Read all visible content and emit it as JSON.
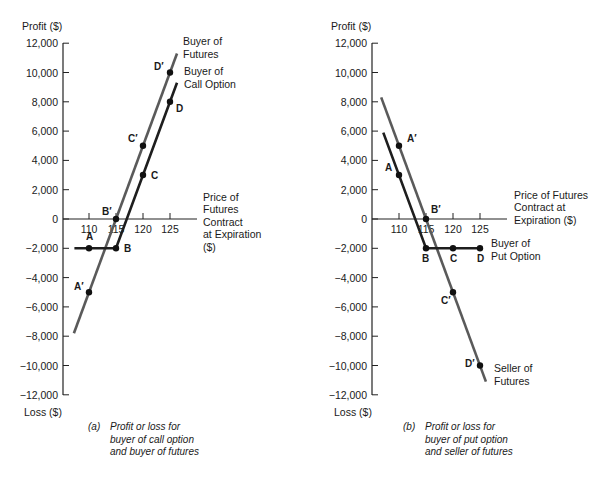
{
  "chart_data": [
    {
      "type": "line",
      "panel": "a",
      "title": "(a) Profit or loss for buyer of call option and buyer of futures",
      "caption_lines": [
        "(a)",
        "Profit or loss for",
        "buyer of call option",
        "and buyer of futures"
      ],
      "ylabel_top": "Profit ($)",
      "ylabel_bottom": "Loss ($)",
      "xlabel_lines": [
        "Price of",
        "Futures",
        "Contract",
        "at Expiration",
        "($)"
      ],
      "ylim": [
        -12000,
        12000
      ],
      "yticks": [
        12000,
        10000,
        8000,
        6000,
        4000,
        2000,
        0,
        -2000,
        -4000,
        -6000,
        -8000,
        -10000,
        -12000
      ],
      "ytick_labels": [
        "12,000",
        "10,000",
        "8,000",
        "6,000",
        "4,000",
        "2,000",
        "0",
        "−2,000",
        "−4,000",
        "−6,000",
        "−8,000",
        "−10,000",
        "−12,000"
      ],
      "xticks": [
        110,
        115,
        120,
        125
      ],
      "xtick_labels": [
        "110",
        "115",
        "120",
        "125"
      ],
      "grid": false,
      "series": [
        {
          "name": "Buyer of Futures",
          "label_lines": [
            "Buyer of",
            "Futures"
          ],
          "color": "#5a5a5a",
          "line": [
            [
              107.2,
              -7800
            ],
            [
              126.3,
              11300
            ]
          ],
          "points": [
            {
              "label": "A′",
              "x": 110,
              "y": -5000
            },
            {
              "label": "B′",
              "x": 115,
              "y": 0
            },
            {
              "label": "C′",
              "x": 120,
              "y": 5000
            },
            {
              "label": "D′",
              "x": 125,
              "y": 10000
            }
          ]
        },
        {
          "name": "Buyer of Call Option",
          "label_lines": [
            "Buyer of",
            "Call Option"
          ],
          "color": "#1e1e1e",
          "line": [
            [
              107.3,
              -2000
            ],
            [
              115,
              -2000
            ],
            [
              126.3,
              9300
            ]
          ],
          "points": [
            {
              "label": "A",
              "x": 110,
              "y": -2000
            },
            {
              "label": "B",
              "x": 115,
              "y": -2000
            },
            {
              "label": "C",
              "x": 120,
              "y": 3000
            },
            {
              "label": "D",
              "x": 125,
              "y": 8000
            }
          ]
        }
      ]
    },
    {
      "type": "line",
      "panel": "b",
      "title": "(b) Profit or loss for buyer of put option and seller of futures",
      "caption_lines": [
        "(b)",
        "Profit or loss for",
        "buyer of put option",
        "and seller of futures"
      ],
      "ylabel_top": "Profit ($)",
      "ylabel_bottom": "Loss ($)",
      "xlabel_lines": [
        "Price of Futures",
        "Contract at",
        "Expiration ($)"
      ],
      "ylim": [
        -12000,
        12000
      ],
      "yticks": [
        12000,
        10000,
        8000,
        6000,
        4000,
        2000,
        0,
        -2000,
        -4000,
        -6000,
        -8000,
        -10000,
        -12000
      ],
      "ytick_labels": [
        "12,000",
        "10,000",
        "8,000",
        "6,000",
        "4,000",
        "2,000",
        "0",
        "−2,000",
        "−4,000",
        "−6,000",
        "−8,000",
        "−10,000",
        "−12,000"
      ],
      "xticks": [
        110,
        115,
        120,
        125
      ],
      "xtick_labels": [
        "110",
        "115",
        "120",
        "125"
      ],
      "grid": false,
      "series": [
        {
          "name": "Seller of Futures",
          "label_lines": [
            "Seller of",
            "Futures"
          ],
          "color": "#5a5a5a",
          "line": [
            [
              106.7,
              8300
            ],
            [
              126.1,
              -11100
            ]
          ],
          "points": [
            {
              "label": "A′",
              "x": 110,
              "y": 5000
            },
            {
              "label": "B′",
              "x": 115,
              "y": 0
            },
            {
              "label": "C′",
              "x": 120,
              "y": -5000
            },
            {
              "label": "D′",
              "x": 125,
              "y": -10000
            }
          ]
        },
        {
          "name": "Buyer of Put Option",
          "label_lines": [
            "Buyer of",
            "Put Option"
          ],
          "color": "#1e1e1e",
          "line": [
            [
              107.1,
              5900
            ],
            [
              115,
              -2000
            ],
            [
              125,
              -2000
            ]
          ],
          "points": [
            {
              "label": "A",
              "x": 110,
              "y": 3000
            },
            {
              "label": "B",
              "x": 115,
              "y": -2000
            },
            {
              "label": "C",
              "x": 120,
              "y": -2000
            },
            {
              "label": "D",
              "x": 125,
              "y": -2000
            }
          ]
        }
      ]
    }
  ]
}
